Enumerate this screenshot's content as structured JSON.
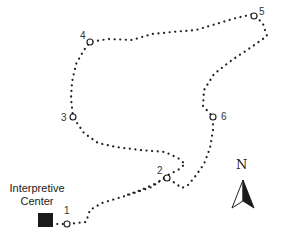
{
  "map": {
    "type": "trail-map",
    "building": {
      "label_line1": "Interpretive",
      "label_line2": "Center",
      "icon": "square-building-icon",
      "color": "#1a1a1a"
    },
    "stops": [
      {
        "id": "1",
        "label": "1"
      },
      {
        "id": "2",
        "label": "2"
      },
      {
        "id": "3",
        "label": "3"
      },
      {
        "id": "4",
        "label": "4"
      },
      {
        "id": "5",
        "label": "5"
      },
      {
        "id": "6",
        "label": "6"
      }
    ],
    "compass": {
      "label": "N",
      "icon": "north-arrow-icon"
    },
    "trail_style": "dotted",
    "trail_color": "#222222"
  }
}
